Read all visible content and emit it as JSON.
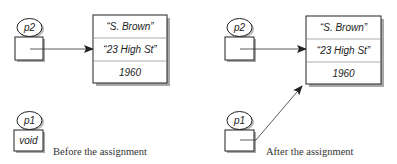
{
  "panels": [
    {
      "caption": "Before the assignment",
      "variables": [
        {
          "name": "p2",
          "value": "",
          "points_to_object": true
        },
        {
          "name": "p1",
          "value": "void",
          "points_to_object": false
        }
      ],
      "object": {
        "fields": [
          "“S. Brown”",
          "“23 High St”",
          "1960"
        ]
      }
    },
    {
      "caption": "After the assignment",
      "variables": [
        {
          "name": "p2",
          "value": "",
          "points_to_object": true
        },
        {
          "name": "p1",
          "value": "",
          "points_to_object": true
        }
      ],
      "object": {
        "fields": [
          "“S. Brown”",
          "“23 High St”",
          "1960"
        ]
      }
    }
  ],
  "colors": {
    "stroke": "#222222",
    "shadow": "#9a9a9a",
    "divider": "#888888",
    "arrow": "#333333"
  }
}
